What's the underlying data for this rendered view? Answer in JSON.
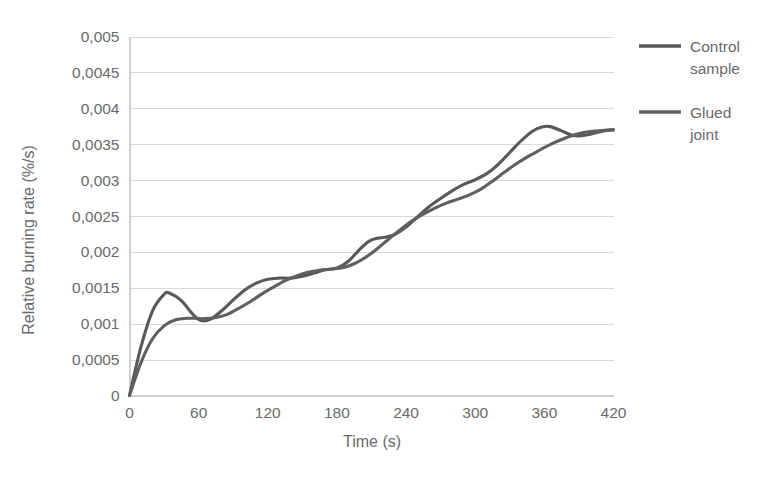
{
  "chart_data": {
    "type": "line",
    "title": "",
    "xlabel": "Time (s)",
    "ylabel": "Relative burning rate (%/s)",
    "xlim": [
      0,
      420
    ],
    "ylim": [
      0,
      0.005
    ],
    "grid": true,
    "legend_position": "right",
    "x_ticks": [
      "0",
      "60",
      "120",
      "180",
      "240",
      "300",
      "360",
      "420"
    ],
    "x_tick_values": [
      0,
      60,
      120,
      180,
      240,
      300,
      360,
      420
    ],
    "y_ticks": [
      "0",
      "0,0005",
      "0,001",
      "0,0015",
      "0,002",
      "0,0025",
      "0,003",
      "0,0035",
      "0,004",
      "0,0045",
      "0,005"
    ],
    "y_tick_values": [
      0,
      0.0005,
      0.001,
      0.0015,
      0.002,
      0.0025,
      0.003,
      0.0035,
      0.004,
      0.0045,
      0.005
    ],
    "decimal_separator": ",",
    "colors": {
      "control_sample": "#595959",
      "glued_joint": "#5f5f5f",
      "gridline": "#d9d9d9",
      "axis": "#cfcfcf",
      "text": "#6a6a6a",
      "background": "#ffffff"
    },
    "series": [
      {
        "name": "Control sample",
        "color": "#595959",
        "x": [
          0,
          10,
          20,
          30,
          35,
          45,
          55,
          62,
          70,
          80,
          90,
          100,
          110,
          120,
          130,
          140,
          150,
          160,
          170,
          180,
          190,
          200,
          208,
          215,
          222,
          230,
          240,
          250,
          260,
          270,
          280,
          290,
          300,
          310,
          320,
          330,
          340,
          350,
          358,
          365,
          375,
          385,
          395,
          405,
          415,
          420
        ],
        "values": [
          0,
          0.00068,
          0.00118,
          0.00141,
          0.001425,
          0.00132,
          0.00113,
          0.001045,
          0.00106,
          0.00118,
          0.00133,
          0.00147,
          0.001565,
          0.00162,
          0.001635,
          0.001635,
          0.00166,
          0.001705,
          0.00175,
          0.001775,
          0.00187,
          0.00204,
          0.00215,
          0.00219,
          0.002205,
          0.00224,
          0.002345,
          0.00249,
          0.00263,
          0.002745,
          0.00285,
          0.00294,
          0.003005,
          0.00309,
          0.00322,
          0.003385,
          0.00355,
          0.003685,
          0.00374,
          0.003745,
          0.003685,
          0.00362,
          0.003625,
          0.00366,
          0.003695,
          0.0037
        ]
      },
      {
        "name": "Glued joint",
        "color": "#5f5f5f",
        "x": [
          0,
          10,
          20,
          30,
          40,
          50,
          58,
          65,
          75,
          85,
          95,
          105,
          115,
          125,
          135,
          145,
          155,
          165,
          175,
          185,
          195,
          205,
          215,
          225,
          235,
          245,
          255,
          265,
          275,
          285,
          295,
          305,
          315,
          325,
          335,
          345,
          355,
          365,
          375,
          385,
          395,
          405,
          415,
          420
        ],
        "values": [
          0,
          0.00046,
          0.00079,
          0.00097,
          0.001055,
          0.001075,
          0.001075,
          0.00107,
          0.001085,
          0.00113,
          0.001215,
          0.00131,
          0.001415,
          0.00151,
          0.0016,
          0.001665,
          0.001715,
          0.001745,
          0.00176,
          0.00178,
          0.001835,
          0.001925,
          0.002045,
          0.00218,
          0.00231,
          0.00243,
          0.002525,
          0.00261,
          0.00268,
          0.002735,
          0.002795,
          0.002875,
          0.002985,
          0.003105,
          0.00322,
          0.00332,
          0.00341,
          0.003495,
          0.003565,
          0.003625,
          0.003665,
          0.003685,
          0.003698,
          0.0037
        ]
      }
    ]
  },
  "legend": {
    "items": [
      {
        "label_line1": "Control",
        "label_line2": "sample"
      },
      {
        "label_line1": "Glued",
        "label_line2": "joint"
      }
    ]
  }
}
